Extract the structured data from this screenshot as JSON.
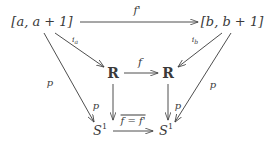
{
  "diagram": {
    "kind": "commutative-diagram",
    "nodes": [
      {
        "id": "interval-a",
        "label": "[a, a + 1]",
        "latex": "[a,a+1]",
        "x": 42,
        "y": 21
      },
      {
        "id": "interval-b",
        "label": "[b, b + 1]",
        "latex": "[b,b+1]",
        "x": 232,
        "y": 21
      },
      {
        "id": "reals-left",
        "label": "R",
        "latex": "\\mathbb{R}",
        "x": 113,
        "y": 73
      },
      {
        "id": "reals-right",
        "label": "R",
        "latex": "\\mathbb{R}",
        "x": 168,
        "y": 73
      },
      {
        "id": "circle-left",
        "label": "S",
        "sup": "1",
        "latex": "S^1",
        "x": 100,
        "y": 130
      },
      {
        "id": "circle-right",
        "label": "S",
        "sup": "1",
        "latex": "S^1",
        "x": 166,
        "y": 130
      }
    ],
    "edges": [
      {
        "id": "top-arrow",
        "from": "interval-a",
        "to": "interval-b",
        "label": "f'",
        "label_x": 137,
        "label_y": 10
      },
      {
        "id": "middle-arrow",
        "from": "reals-left",
        "to": "reals-right",
        "label": "f",
        "label_x": 140,
        "label_y": 62
      },
      {
        "id": "bottom-arrow",
        "from": "circle-left",
        "to": "circle-right",
        "label": "f = f'",
        "label_x": 133,
        "label_y": 120,
        "overbar": true
      },
      {
        "id": "inclusion-a",
        "from": "interval-a",
        "to": "reals-left",
        "label": "i",
        "sub": "a",
        "label_x": 75,
        "label_y": 40
      },
      {
        "id": "inclusion-b",
        "from": "interval-b",
        "to": "reals-right",
        "label": "i",
        "sub": "b",
        "label_x": 195,
        "label_y": 40
      },
      {
        "id": "projection-left-outer",
        "from": "interval-a",
        "to": "circle-left",
        "label": "p",
        "label_x": 50,
        "label_y": 83
      },
      {
        "id": "projection-right-outer",
        "from": "interval-b",
        "to": "circle-right",
        "label": "p",
        "label_x": 213,
        "label_y": 85
      },
      {
        "id": "projection-left-inner",
        "from": "reals-left",
        "to": "circle-left",
        "label": "p",
        "label_x": 96,
        "label_y": 106
      },
      {
        "id": "projection-right-inner",
        "from": "reals-right",
        "to": "circle-right",
        "label": "p",
        "label_x": 178,
        "label_y": 106
      }
    ],
    "colors": {
      "ink": "#3a3a3a",
      "background": "#ffffff"
    }
  }
}
